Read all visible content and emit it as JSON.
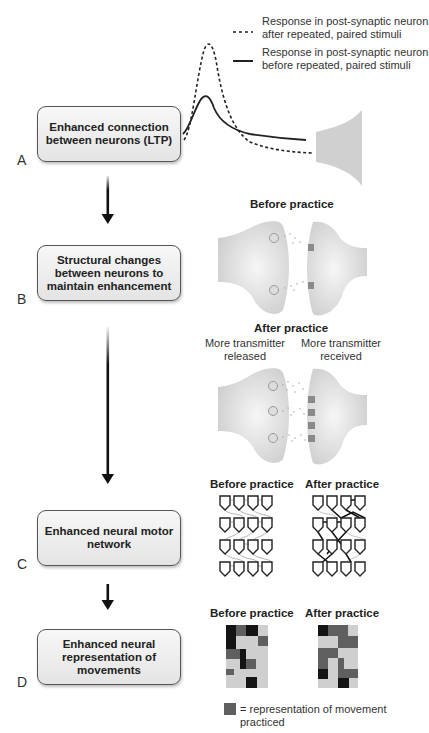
{
  "legend": {
    "dashed_label": "Response in post-synaptic neuron after repeated, paired stimuli",
    "dashed_line1": "Response in post-synaptic neuron",
    "dashed_line2": "after repeated, paired stimuli",
    "solid_line1": "Response in post-synaptic neuron",
    "solid_line2": "before repeated, paired stimuli"
  },
  "stages": [
    {
      "letter": "A",
      "line1": "Enhanced connection",
      "line2": "between neurons (LTP)",
      "line3": ""
    },
    {
      "letter": "B",
      "line1": "Structural changes",
      "line2": "between neurons to",
      "line3": "maintain enhancement"
    },
    {
      "letter": "C",
      "line1": "Enhanced neural motor",
      "line2": "network",
      "line3": ""
    },
    {
      "letter": "D",
      "line1": "Enhanced neural",
      "line2": "representation of",
      "line3": "movements"
    }
  ],
  "panel_b": {
    "before_title": "Before practice",
    "after_title": "After practice",
    "released_line1": "More transmitter",
    "released_line2": "released",
    "received_line1": "More transmitter",
    "received_line2": "received"
  },
  "panel_c": {
    "before_title": "Before practice",
    "after_title": "After practice"
  },
  "panel_d": {
    "before_title": "Before practice",
    "after_title": "After practice",
    "legend_line1": "= representation of movement",
    "legend_line2": "practiced"
  },
  "colors": {
    "neuron_fill": "#d4d4d4",
    "light_cell": "#cfcfcf",
    "mid_cell": "#5f5f5f",
    "dark_cell": "#141414",
    "arrow": "#111111"
  }
}
